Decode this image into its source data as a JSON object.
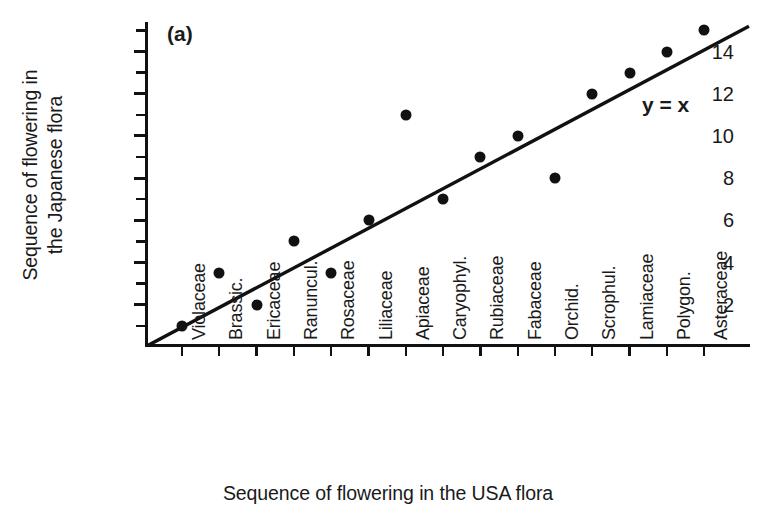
{
  "chart_data": {
    "type": "scatter",
    "title": "",
    "panel_label": "(a)",
    "xlabel": "Sequence of flowering in the USA flora",
    "ylabel_line1": "Sequence of flowering in",
    "ylabel_line2": "the Japanese flora",
    "annotation": "y = x",
    "grid": false,
    "legend": "none",
    "ylim": [
      0,
      15.4
    ],
    "yticks_major": [
      2,
      4,
      6,
      8,
      10,
      12,
      14
    ],
    "yticks_minor": [
      1,
      3,
      5,
      7,
      9,
      11,
      13,
      15
    ],
    "ytick_labels": [
      "2",
      "4",
      "6",
      "8",
      "10",
      "12",
      "14"
    ],
    "categories": [
      "Violaceae",
      "Brassic.",
      "Ericaceae",
      "Ranuncul.",
      "Rosaceae",
      "Liliaceae",
      "Apiaceae",
      "Caryophyl.",
      "Rubiaceae",
      "Fabaceae",
      "Orchid.",
      "Scrophul.",
      "Lamiaceae",
      "Polygon.",
      "Asteraceae"
    ],
    "x": [
      1,
      2,
      3,
      4,
      5,
      6,
      7,
      8,
      9,
      10,
      11,
      12,
      13,
      14,
      15
    ],
    "values": [
      1,
      3.5,
      2,
      5,
      3.5,
      6,
      11,
      7,
      9,
      10,
      8,
      12,
      13,
      14,
      15
    ],
    "reference_line": {
      "label": "y = x",
      "slope": 1,
      "intercept": 0,
      "x_start": 0,
      "x_end": 15.4
    },
    "marker": {
      "shape": "filled-circle",
      "color": "#111111",
      "size_px": 11
    },
    "axis_color": "#111111"
  }
}
